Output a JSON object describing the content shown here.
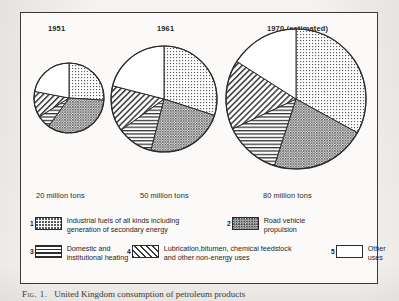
{
  "figure": {
    "caption": "Fig. 1.  United Kingdom consumption of petroleum products",
    "caption_prefix": "Fig. 1.",
    "caption_rest": "United Kingdom consumption of petroleum products"
  },
  "charts": [
    {
      "year_label": "1951",
      "tons_label": "20 million tons"
    },
    {
      "year_label": "1961",
      "tons_label": "50 million tons"
    },
    {
      "year_label": "1970  (estimated)",
      "tons_label": "80 million tons"
    }
  ],
  "legend": [
    {
      "number": "1",
      "pattern": "light-dots",
      "line1": "Industrial fuels of all kinds including",
      "line2": "generation of secondary energy"
    },
    {
      "number": "2",
      "pattern": "dense-dots",
      "line1": "Road vehicle",
      "line2": "propulsion"
    },
    {
      "number": "3",
      "pattern": "horizontal",
      "line1": "Domestic and",
      "line2": "institutional heating"
    },
    {
      "number": "4",
      "pattern": "diagonal",
      "line1": "Lubrication,bitumen, chemical  feedstock",
      "line2": "and other non-energy uses"
    },
    {
      "number": "5",
      "pattern": "white",
      "line1": "Other",
      "line2": "uses"
    }
  ],
  "colors": {
    "frame": "#3b3b3b",
    "paper": "#f4f3f0",
    "ink": "#1a1a1a",
    "pie_stroke": "#2b2b2b"
  },
  "chart_data": {
    "type": "pie",
    "title": "United Kingdom consumption of petroleum products",
    "xlabel": "",
    "ylabel": "",
    "legend_position": "bottom",
    "grid": false,
    "note": "Three pies sized by total tonnage; slices ordered clockwise from 12 o'clock.",
    "categories": [
      "Industrial fuels of all kinds including generation of secondary energy",
      "Road vehicle propulsion",
      "Domestic and institutional heating",
      "Lubrication, bitumen, chemical feedstock and other non-energy uses",
      "Other uses"
    ],
    "category_numbers": [
      "1",
      "2",
      "3",
      "4",
      "5"
    ],
    "unit": "percent of total",
    "pies": [
      {
        "name": "1951",
        "total": 20,
        "total_unit": "million tons",
        "total_label": "20 million tons",
        "radius_px": 35,
        "values": [
          26,
          34,
          6,
          12,
          22
        ]
      },
      {
        "name": "1961",
        "total": 50,
        "total_unit": "million tons",
        "total_label": "50 million tons",
        "radius_px": 53,
        "values": [
          30,
          24,
          11,
          14,
          21
        ]
      },
      {
        "name": "1970 (estimated)",
        "total": 80,
        "total_unit": "million tons",
        "total_label": "80 million tons",
        "radius_px": 70,
        "values": [
          33,
          22,
          13,
          16,
          16
        ]
      }
    ]
  }
}
